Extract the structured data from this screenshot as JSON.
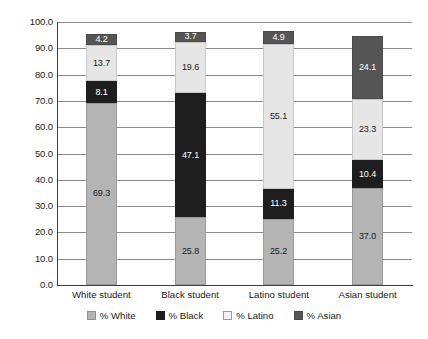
{
  "chart_data": {
    "type": "bar",
    "subtype": "stacked-bar",
    "title": "",
    "subtitle": "",
    "xlabel": "",
    "ylabel": "",
    "ylim": [
      0.0,
      100.0
    ],
    "ytick_step": 10.0,
    "ytick_labels": [
      "100.0",
      "90.0",
      "80.0",
      "70.0",
      "60.0",
      "50.0",
      "40.0",
      "30.0",
      "20.0",
      "10.0",
      "0.0"
    ],
    "ytick_values": [
      100.0,
      90.0,
      80.0,
      70.0,
      60.0,
      50.0,
      40.0,
      30.0,
      20.0,
      10.0,
      0.0
    ],
    "grid": true,
    "grid_axis": "y",
    "legend_position": "bottom",
    "categories": [
      "White student",
      "Black student",
      "Latino student",
      "Asian student"
    ],
    "series": [
      {
        "name": "% White",
        "color": "#b4b4b4",
        "values": [
          69.3,
          25.8,
          25.2,
          37.0
        ],
        "labels": [
          "69.3",
          "25.8",
          "25.2",
          "37.0"
        ]
      },
      {
        "name": "% Black",
        "color": "#1e1e1e",
        "values": [
          8.1,
          47.1,
          11.3,
          10.4
        ],
        "labels": [
          "8.1",
          "47.1",
          "11.3",
          "10.4"
        ]
      },
      {
        "name": "% Latino",
        "color": "#e6e6e6",
        "values": [
          13.7,
          19.6,
          55.1,
          23.3
        ],
        "labels": [
          "13.7",
          "19.6",
          "55.1",
          "23.3"
        ]
      },
      {
        "name": "% Asian",
        "color": "#555555",
        "values": [
          4.2,
          3.7,
          4.9,
          24.1
        ],
        "labels": [
          "4.2",
          "3.7",
          "4.9",
          "24.1"
        ]
      }
    ],
    "totals": [
      95.3,
      96.2,
      96.5,
      94.8
    ]
  },
  "axis": {
    "y_labels": [
      "100.0",
      "90.0",
      "80.0",
      "70.0",
      "60.0",
      "50.0",
      "40.0",
      "30.0",
      "20.0",
      "10.0",
      "0.0"
    ]
  },
  "categories": {
    "c0": "White student",
    "c1": "Black student",
    "c2": "Latino student",
    "c3": "Asian student"
  },
  "legend": {
    "items": [
      {
        "label": "% White",
        "swatch": "legend-swatch-white"
      },
      {
        "label": "% Black",
        "swatch": "legend-swatch-black"
      },
      {
        "label": "% Latino",
        "swatch": "legend-swatch-latino"
      },
      {
        "label": "% Asian",
        "swatch": "legend-swatch-asian"
      }
    ]
  },
  "values": {
    "white_student": {
      "white": "69.3",
      "black": "8.1",
      "latino": "13.7",
      "asian": "4.2"
    },
    "black_student": {
      "white": "25.8",
      "black": "47.1",
      "latino": "19.6",
      "asian": "3.7"
    },
    "latino_student": {
      "white": "25.2",
      "black": "11.3",
      "latino": "55.1",
      "asian": "4.9"
    },
    "asian_student": {
      "white": "37.0",
      "black": "10.4",
      "latino": "23.3",
      "asian": "24.1"
    }
  },
  "colors": {
    "white_segment": "#b4b4b4",
    "black_segment": "#1e1e1e",
    "latino_segment": "#e6e6e6",
    "asian_segment": "#555555",
    "gridline": "#8d8d8d",
    "axis": "#3c3c3c",
    "background": "#ffffff",
    "text": "#1a1a1a"
  }
}
